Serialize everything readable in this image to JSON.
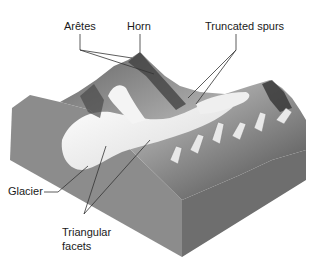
{
  "figure": {
    "labels": {
      "aretes": "Arêtes",
      "horn": "Horn",
      "truncated_spurs": "Truncated spurs",
      "glacier": "Glacier",
      "triangular_facets_line1": "Triangular",
      "triangular_facets_line2": "facets"
    }
  },
  "colors": {
    "background": "#ffffff",
    "block_side_left": "#8c8c8c",
    "block_side_right": "#6e6e6e",
    "terrain_dark": "#4a4a4a",
    "terrain_mid": "#9a9a9a",
    "ice": "#f2f2f2",
    "leader_line": "#333333",
    "text": "#1a1a1a"
  }
}
